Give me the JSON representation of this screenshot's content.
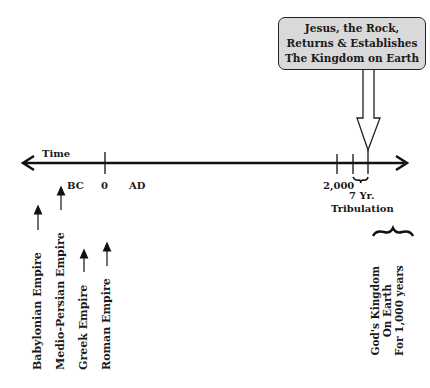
{
  "callout": {
    "lines": [
      "Jesus, the Rock,",
      "Returns & Establishes",
      "The Kingdom on Earth"
    ],
    "fill": "#d9d9d9"
  },
  "timeline": {
    "axis_label": "Time",
    "bc_label": "BC",
    "zero_label": "0",
    "ad_label": "AD",
    "year_2000_label": "2,000",
    "tribulation_label": [
      "7 Yr.",
      "Tribulation"
    ]
  },
  "empires": [
    {
      "label": "Babylonian Empire"
    },
    {
      "label": "Medio-Persian Empire"
    },
    {
      "label": "Greek Empire"
    },
    {
      "label": "Roman Empire"
    }
  ],
  "kingdom": {
    "lines": [
      "God's Kingdom",
      "On Earth",
      "For 1,000 years"
    ]
  }
}
